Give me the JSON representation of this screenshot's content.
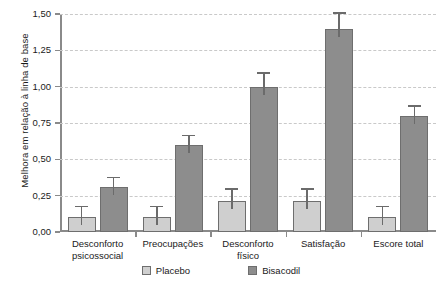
{
  "chart_data": {
    "type": "bar",
    "title": "",
    "subtitle": "",
    "xlabel": "",
    "ylabel": "Melhora em relação à linha de base",
    "ylim": [
      0.0,
      1.5
    ],
    "yticks": [
      0.0,
      0.25,
      0.5,
      0.75,
      1.0,
      1.25,
      1.5
    ],
    "ytick_labels": [
      "0,00",
      "0,25",
      "0,50",
      "0,75",
      "1,00",
      "1,25",
      "1,50"
    ],
    "grid": true,
    "legend_position": "bottom",
    "decimal_separator": ",",
    "categories": [
      "Desconforto psicossocial",
      "Preocupações",
      "Desconforto físico",
      "Satisfação",
      "Escore total"
    ],
    "category_lines": [
      [
        "Desconforto",
        "psicossocial"
      ],
      [
        "Preocupações"
      ],
      [
        "Desconforto",
        "físico"
      ],
      [
        "Satisfação"
      ],
      [
        "Escore total"
      ]
    ],
    "series": [
      {
        "name": "Placebo",
        "color": "#cfcfcf",
        "values": [
          0.1,
          0.1,
          0.21,
          0.21,
          0.1
        ],
        "errors_upper": [
          0.07,
          0.07,
          0.08,
          0.08,
          0.07
        ]
      },
      {
        "name": "Bisacodil",
        "color": "#8d8d8d",
        "values": [
          0.31,
          0.6,
          1.0,
          1.4,
          0.8
        ],
        "errors_upper": [
          0.06,
          0.06,
          0.09,
          0.1,
          0.06
        ]
      }
    ]
  },
  "legend": {
    "items": [
      {
        "label": "Placebo",
        "color": "#cfcfcf"
      },
      {
        "label": "Bisacodil",
        "color": "#8d8d8d"
      }
    ]
  }
}
